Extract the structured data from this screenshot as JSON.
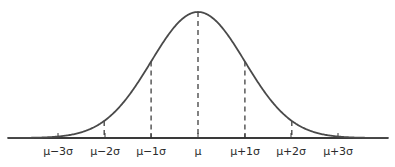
{
  "figure": {
    "title": "",
    "background_color": "#ffffff",
    "width": 395,
    "height": 167
  },
  "style": {
    "curve_color": "#4a4a4a",
    "axis_color": "#3a3a3a",
    "dash_color": "#2f2f2f",
    "label_color": "#2b2b2b",
    "curve_width": 1.8,
    "axis_width": 2.0,
    "dash_width": 1.2,
    "tick_width": 1.0,
    "tick_length": 5
  },
  "axis": {
    "y_pixel": 138,
    "x_start_pixel": 8,
    "x_end_pixel": 388,
    "ticks": [
      {
        "label": "μ−3σ",
        "x_pixel": 58,
        "sigma": -3
      },
      {
        "label": "μ−2σ",
        "x_pixel": 105,
        "sigma": -2
      },
      {
        "label": "μ−1σ",
        "x_pixel": 151,
        "sigma": -1
      },
      {
        "label": "μ",
        "x_pixel": 198,
        "sigma": 0
      },
      {
        "label": "μ+1σ",
        "x_pixel": 245,
        "sigma": 1
      },
      {
        "label": "μ+2σ",
        "x_pixel": 291,
        "sigma": 2
      },
      {
        "label": "μ+3σ",
        "x_pixel": 338,
        "sigma": 3
      }
    ],
    "label_y_pixel": 146
  },
  "dashed_lines": [
    {
      "name": "minus-2-sigma",
      "sigma": -2,
      "x_pixel": 105,
      "top_pixel": 100.0,
      "bottom_pixel": 138
    },
    {
      "name": "minus-1-sigma",
      "sigma": -1,
      "x_pixel": 151,
      "top_pixel": 45.3,
      "bottom_pixel": 138
    },
    {
      "name": "mu",
      "sigma": 0,
      "x_pixel": 198,
      "top_pixel": 12.0,
      "bottom_pixel": 138
    },
    {
      "name": "plus-1-sigma",
      "sigma": 1,
      "x_pixel": 245,
      "top_pixel": 45.3,
      "bottom_pixel": 138
    },
    {
      "name": "plus-2-sigma",
      "sigma": 2,
      "x_pixel": 291,
      "top_pixel": 100.0,
      "bottom_pixel": 138
    }
  ],
  "chart_data": {
    "type": "line",
    "title": "",
    "subtitle": "",
    "xlabel": "",
    "ylabel": "",
    "curve": "gaussian",
    "mean": 0,
    "std": 1,
    "grid": false,
    "legend": null,
    "xlim": [
      -4.05,
      4.05
    ],
    "ylim": [
      0,
      1
    ],
    "xticks": [
      -3,
      -2,
      -1,
      0,
      1,
      2,
      3
    ],
    "xticklabels": [
      "μ−3σ",
      "μ−2σ",
      "μ−1σ",
      "μ",
      "μ+1σ",
      "μ+2σ",
      "μ+3σ"
    ],
    "yticks": [],
    "yticklabels": [],
    "series": [
      {
        "name": "normal-density",
        "x": [
          -4.0,
          -3.75,
          -3.5,
          -3.25,
          -3.0,
          -2.75,
          -2.5,
          -2.25,
          -2.0,
          -1.75,
          -1.5,
          -1.25,
          -1.0,
          -0.75,
          -0.5,
          -0.25,
          0.0,
          0.25,
          0.5,
          0.75,
          1.0,
          1.25,
          1.5,
          1.75,
          2.0,
          2.25,
          2.5,
          2.75,
          3.0,
          3.25,
          3.5,
          3.75,
          4.0
        ],
        "y": [
          0.0003,
          0.0009,
          0.0022,
          0.0051,
          0.0111,
          0.0228,
          0.0439,
          0.0796,
          0.1353,
          0.2163,
          0.3247,
          0.4578,
          0.6065,
          0.7548,
          0.8825,
          0.9692,
          1.0,
          0.9692,
          0.8825,
          0.7548,
          0.6065,
          0.4578,
          0.3247,
          0.2163,
          0.1353,
          0.0796,
          0.0439,
          0.0228,
          0.0111,
          0.0051,
          0.0022,
          0.0009,
          0.0003
        ]
      }
    ],
    "annotations": [
      {
        "at_sigma": -2,
        "type": "dashed-drop-line"
      },
      {
        "at_sigma": -1,
        "type": "dashed-drop-line"
      },
      {
        "at_sigma": 0,
        "type": "dashed-drop-line"
      },
      {
        "at_sigma": 1,
        "type": "dashed-drop-line"
      },
      {
        "at_sigma": 2,
        "type": "dashed-drop-line"
      }
    ]
  }
}
